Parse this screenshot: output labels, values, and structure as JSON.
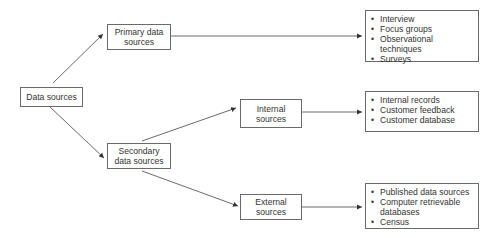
{
  "diagram": {
    "root": {
      "label": "Data sources"
    },
    "primary": {
      "label_line1": "Primary data",
      "label_line2": "sources",
      "items": [
        "Interview",
        "Focus groups",
        "Observational techniques",
        "Surveys"
      ]
    },
    "secondary": {
      "label_line1": "Secondary",
      "label_line2": "data sources"
    },
    "internal": {
      "label_line1": "Internal",
      "label_line2": "sources",
      "items": [
        "Internal records",
        "Customer feedback",
        "Customer database"
      ]
    },
    "external": {
      "label_line1": "External",
      "label_line2": "sources",
      "items": [
        "Published data sources",
        "Computer retrievable databases",
        "Census"
      ]
    }
  }
}
